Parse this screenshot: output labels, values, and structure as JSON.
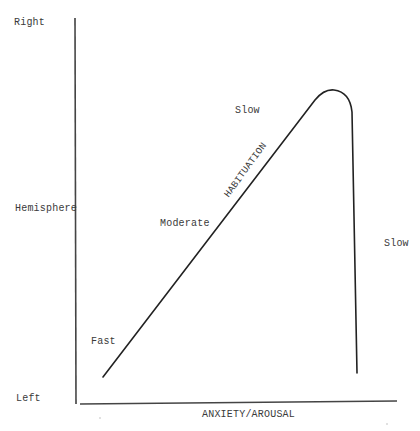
{
  "diagram": {
    "y_axis": {
      "top_label": "Right",
      "middle_label": "Hemisphere",
      "bottom_label": "Left"
    },
    "x_axis": {
      "label": "ANXIETY/AROUSAL"
    },
    "curve": {
      "label": "HABITUATION",
      "color": "#222222"
    },
    "annotations": {
      "fast": "Fast",
      "moderate": "Moderate",
      "slow_top": "Slow",
      "slow_right": "Slow"
    }
  }
}
